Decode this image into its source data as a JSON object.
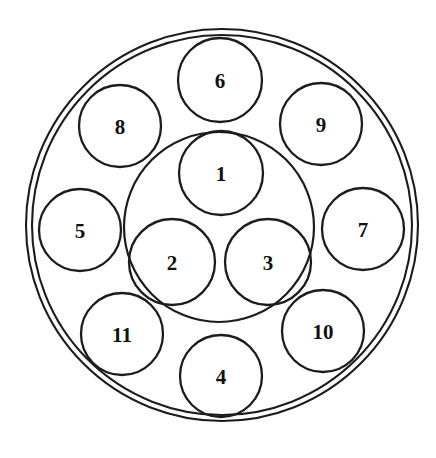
{
  "diagram": {
    "type": "circle-packing",
    "canvas": {
      "width": 436,
      "height": 458,
      "background": "#ffffff"
    },
    "stroke_color": "#1c1c1c",
    "label_color": "#111111",
    "outer_ring": {
      "name": "outer-boundary-ring",
      "cx": 222,
      "cy": 225,
      "r_outer": 196,
      "r_inner": 190,
      "description": "double-line outer disc boundary"
    },
    "inner_boundary": {
      "name": "inner-group-boundary",
      "cx": 219,
      "cy": 227,
      "r": 95,
      "description": "circle enclosing nodes 1, 2 and 3"
    },
    "nodes": [
      {
        "id": "1",
        "label": "1",
        "cx": 221,
        "cy": 173,
        "r": 42,
        "group": "inner"
      },
      {
        "id": "2",
        "label": "2",
        "cx": 172,
        "cy": 262,
        "r": 43,
        "group": "inner"
      },
      {
        "id": "3",
        "label": "3",
        "cx": 268,
        "cy": 262,
        "r": 43,
        "group": "inner"
      },
      {
        "id": "4",
        "label": "4",
        "cx": 221,
        "cy": 376,
        "r": 41,
        "group": "outer"
      },
      {
        "id": "5",
        "label": "5",
        "cx": 80,
        "cy": 230,
        "r": 41,
        "group": "outer"
      },
      {
        "id": "6",
        "label": "6",
        "cx": 220,
        "cy": 80,
        "r": 42,
        "group": "outer"
      },
      {
        "id": "7",
        "label": "7",
        "cx": 363,
        "cy": 229,
        "r": 41,
        "group": "outer"
      },
      {
        "id": "8",
        "label": "8",
        "cx": 120,
        "cy": 126,
        "r": 41,
        "group": "outer"
      },
      {
        "id": "9",
        "label": "9",
        "cx": 321,
        "cy": 124,
        "r": 41,
        "group": "outer"
      },
      {
        "id": "10",
        "label": "10",
        "cx": 323,
        "cy": 331,
        "r": 41,
        "group": "outer"
      },
      {
        "id": "11",
        "label": "11",
        "cx": 122,
        "cy": 334,
        "r": 41,
        "group": "outer"
      }
    ]
  },
  "chart_data": {
    "type": "scatter",
    "xlabel": "",
    "ylabel": "",
    "xlim": [
      0,
      436
    ],
    "ylim": [
      458,
      0
    ],
    "grid": false,
    "legend": "none",
    "categories": [
      "1",
      "2",
      "3",
      "4",
      "5",
      "6",
      "7",
      "8",
      "9",
      "10",
      "11"
    ],
    "series": [
      {
        "name": "cx",
        "values": [
          221,
          172,
          268,
          221,
          80,
          220,
          363,
          120,
          321,
          323,
          122
        ]
      },
      {
        "name": "cy",
        "values": [
          173,
          262,
          262,
          376,
          230,
          80,
          229,
          126,
          124,
          331,
          334
        ]
      },
      {
        "name": "radius",
        "values": [
          42,
          43,
          43,
          41,
          41,
          42,
          41,
          41,
          41,
          41,
          41
        ]
      }
    ],
    "annotations": [
      "Outer double ring centered at (222, 225), outer radius 196, inner radius 190",
      "Inner group boundary circle centered at (219, 227), radius 95, encloses circles 1, 2 and 3"
    ]
  }
}
